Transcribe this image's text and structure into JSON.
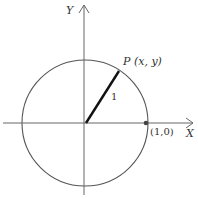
{
  "diagram": {
    "type": "unit-circle",
    "axes": {
      "x_label": "X",
      "y_label": "Y"
    },
    "point_p": {
      "label": "P (x, y)"
    },
    "radius_label": "1",
    "point_unit": {
      "label": "(1,0)"
    },
    "colors": {
      "line": "#555555",
      "radius": "#111111",
      "text": "#333333"
    }
  }
}
